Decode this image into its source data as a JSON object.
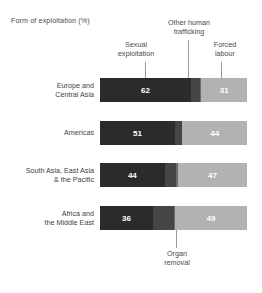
{
  "title": "Form of exploitation (%)",
  "annotations": {
    "sexual": "Sexual\nexploitation",
    "sexual_line1": "Sexual",
    "sexual_line2": "exploitation",
    "other_line1": "Other human",
    "other_line2": "trafficking",
    "forced_line1": "Forced",
    "forced_line2": "labour",
    "organ_line1": "Organ",
    "organ_line2": "removal"
  },
  "colors": {
    "sexual_exploitation": "#2b2b2b",
    "other_human_trafficking": "#454545",
    "organ_removal": "#6d6d6d",
    "forced_labour": "#b2b2b2",
    "background": "#ffffff",
    "text": "#3f3f3f",
    "leader_line": "#9a9a9a"
  },
  "chart_data": {
    "type": "bar",
    "subtype": "stacked-horizontal",
    "title": "Form of exploitation (%)",
    "xlabel": "",
    "ylabel": "",
    "xlim": [
      0,
      100
    ],
    "grid": false,
    "legend_position": "top-annotations",
    "categories": [
      "Europe and Central Asia",
      "Americas",
      "South Asia, East Asia & the Pacific",
      "Africa and the Middle East"
    ],
    "category_lines": [
      [
        "Europe and",
        "Central Asia"
      ],
      [
        "Americas",
        ""
      ],
      [
        "South Asia, East Asia",
        "& the Pacific"
      ],
      [
        "Africa and",
        "the Middle East"
      ]
    ],
    "series": [
      {
        "name": "Sexual exploitation",
        "color": "#2b2b2b",
        "values": [
          62,
          51,
          44,
          36
        ],
        "labels": [
          "62",
          "51",
          "44",
          "36"
        ],
        "show_labels": true
      },
      {
        "name": "Other human trafficking",
        "color": "#454545",
        "values": [
          6,
          5,
          8,
          14
        ],
        "labels": [
          "",
          "",
          "",
          ""
        ],
        "show_labels": false
      },
      {
        "name": "Organ removal",
        "color": "#6d6d6d",
        "values": [
          1,
          0,
          1,
          1
        ],
        "labels": [
          "",
          "",
          "",
          ""
        ],
        "show_labels": false
      },
      {
        "name": "Forced labour",
        "color": "#b2b2b2",
        "values": [
          31,
          44,
          47,
          49
        ],
        "labels": [
          "31",
          "44",
          "47",
          "49"
        ],
        "show_labels": true
      }
    ],
    "annotations": [
      {
        "text": "Sexual exploitation",
        "points_to": "Sexual exploitation"
      },
      {
        "text": "Other human trafficking",
        "points_to": "Other human trafficking"
      },
      {
        "text": "Forced labour",
        "points_to": "Forced labour"
      },
      {
        "text": "Organ removal",
        "points_to": "Organ removal"
      }
    ]
  }
}
